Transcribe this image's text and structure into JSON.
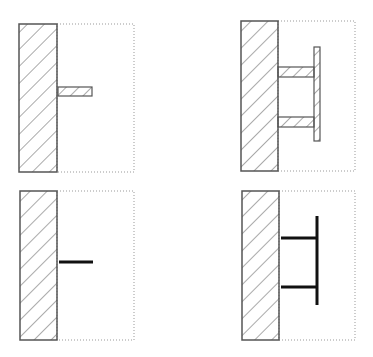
{
  "diagram": {
    "colors": {
      "stroke": "#555555",
      "hatch": "#555555",
      "dotted": "#999999",
      "line_model": "#111111"
    },
    "panels": [
      {
        "id": "top-left",
        "wall": {
          "x": 19,
          "y": 24,
          "w": 38,
          "h": 148
        },
        "box": {
          "x": 57,
          "y": 24,
          "w": 77,
          "h": 148
        },
        "members": [
          {
            "type": "hatched-bar",
            "x": 58,
            "y": 87,
            "w": 34,
            "h": 9
          }
        ]
      },
      {
        "id": "top-right",
        "wall": {
          "x": 241,
          "y": 21,
          "w": 37,
          "h": 150
        },
        "box": {
          "x": 278,
          "y": 21,
          "w": 77,
          "h": 150
        },
        "members": [
          {
            "type": "hatched-bar",
            "x": 278,
            "y": 67,
            "w": 36,
            "h": 10
          },
          {
            "type": "hatched-bar",
            "x": 278,
            "y": 117,
            "w": 36,
            "h": 10
          },
          {
            "type": "hatched-plate",
            "x": 314,
            "y": 47,
            "w": 6,
            "h": 94
          }
        ]
      },
      {
        "id": "bottom-left",
        "wall": {
          "x": 20,
          "y": 191,
          "w": 37,
          "h": 149
        },
        "box": {
          "x": 57,
          "y": 191,
          "w": 77,
          "h": 149
        },
        "members": [
          {
            "type": "line",
            "x1": 59,
            "y1": 262,
            "x2": 93,
            "y2": 262
          }
        ]
      },
      {
        "id": "bottom-right",
        "wall": {
          "x": 242,
          "y": 191,
          "w": 37,
          "h": 149
        },
        "box": {
          "x": 279,
          "y": 191,
          "w": 76,
          "h": 149
        },
        "members": [
          {
            "type": "line",
            "x1": 281,
            "y1": 238,
            "x2": 317,
            "y2": 238
          },
          {
            "type": "line",
            "x1": 281,
            "y1": 287,
            "x2": 317,
            "y2": 287
          },
          {
            "type": "line",
            "x1": 317,
            "y1": 216,
            "x2": 317,
            "y2": 305
          }
        ]
      }
    ]
  }
}
